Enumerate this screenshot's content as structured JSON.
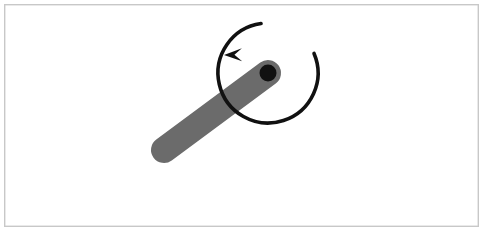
{
  "figure": {
    "title": "Rotating rod about a pivot",
    "kind": "mechanics-diagram",
    "width": 484,
    "height": 232,
    "background_color": "#ffffff",
    "frame": {
      "name": "figure-border",
      "x": 4,
      "y": 4,
      "width": 475,
      "height": 223,
      "stroke_color": "#c8c8c8",
      "stroke_width": 1.4,
      "fill": "#ffffff"
    },
    "rod": {
      "label": "rod",
      "color": "#6b6b6b",
      "thickness": 26,
      "cap": "round",
      "free_end": {
        "x": 164,
        "y": 150
      },
      "pivot_end": {
        "x": 268,
        "y": 73
      },
      "angle_degrees": 36.5
    },
    "pivot": {
      "label": "pivot point",
      "color": "#111111",
      "x": 268,
      "y": 73,
      "radius": 8.5
    },
    "rotation_arrow": {
      "label": "counterclockwise rotation",
      "direction": "counterclockwise",
      "color": "#111111",
      "stroke_width": 3.6,
      "arc_center": {
        "x": 268,
        "y": 73
      },
      "arc_radius": 50,
      "arc_start_angle_degrees": 262,
      "arc_sweep_degrees": 285,
      "arrow_tip": {
        "x": 224,
        "y": 55
      },
      "arrow_head_length": 18,
      "arrow_head_width": 13
    }
  }
}
